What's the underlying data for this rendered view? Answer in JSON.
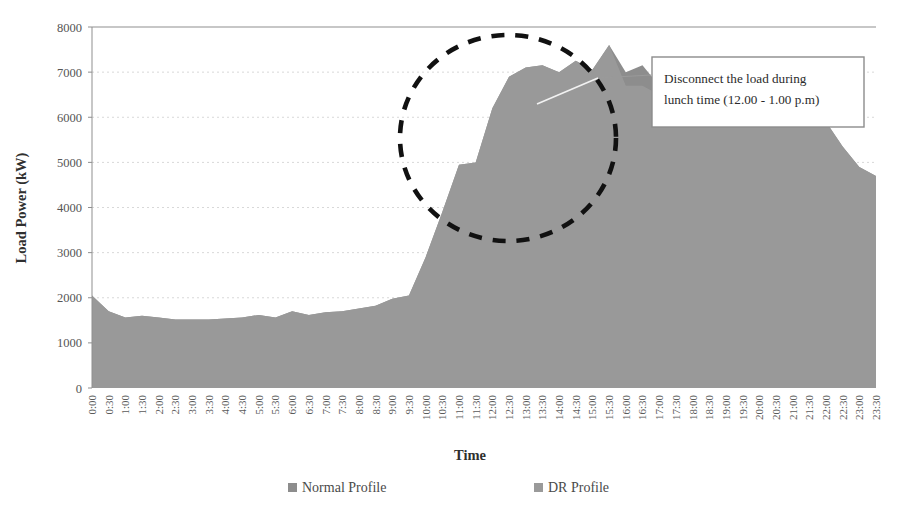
{
  "chart_data": {
    "type": "area",
    "title": "",
    "xlabel": "Time",
    "ylabel": "Load Power (kW)",
    "ylim": [
      0,
      8000
    ],
    "ytick_step": 1000,
    "yticks": [
      0,
      1000,
      2000,
      3000,
      4000,
      5000,
      6000,
      7000,
      8000
    ],
    "grid": true,
    "grid_style": "dotted-horizontal",
    "legend_position": "bottom",
    "categories": [
      "0:00",
      "0:30",
      "1:00",
      "1:30",
      "2:00",
      "2:30",
      "3:00",
      "3:30",
      "4:00",
      "4:30",
      "5:00",
      "5:30",
      "6:00",
      "6:30",
      "7:00",
      "7:30",
      "8:00",
      "8:30",
      "9:00",
      "9:30",
      "10:00",
      "10:30",
      "11:00",
      "11:30",
      "12:00",
      "12:30",
      "13:00",
      "13:30",
      "14:00",
      "14:30",
      "15:00",
      "15:30",
      "16:00",
      "16:30",
      "17:00",
      "17:30",
      "18:00",
      "18:30",
      "19:00",
      "19:30",
      "20:00",
      "20:30",
      "21:00",
      "21:30",
      "22:00",
      "22:30",
      "23:00",
      "23:30"
    ],
    "series": [
      {
        "name": "Normal Profile",
        "color": "#8d8d8d",
        "values": [
          2050,
          1700,
          1560,
          1600,
          1560,
          1520,
          1520,
          1520,
          1540,
          1560,
          1620,
          1560,
          1700,
          1620,
          1680,
          1700,
          1760,
          1820,
          1980,
          2050,
          2900,
          3900,
          4950,
          5000,
          6200,
          6900,
          7100,
          7150,
          7000,
          7250,
          7050,
          7600,
          7000,
          7150,
          6700,
          7000,
          6900,
          7100,
          7050,
          7200,
          7250,
          7150,
          7000,
          6600,
          5900,
          5350,
          4900,
          4700
        ]
      },
      {
        "name": "DR Profile",
        "color": "#9a9a9a",
        "values": [
          2050,
          1700,
          1560,
          1600,
          1560,
          1520,
          1520,
          1520,
          1540,
          1560,
          1620,
          1560,
          1700,
          1620,
          1680,
          1700,
          1760,
          1820,
          1980,
          2050,
          2900,
          3900,
          4950,
          5000,
          6200,
          6900,
          7100,
          7150,
          7000,
          7250,
          7050,
          7600,
          6700,
          6700,
          6500,
          6500,
          6900,
          7100,
          7050,
          7200,
          7250,
          7150,
          7000,
          6600,
          5900,
          5350,
          4900,
          4700
        ]
      }
    ]
  },
  "axes": {
    "y_title": "Load Power (kW)",
    "x_title": "Time",
    "y_tick_labels": [
      "8000",
      "7000",
      "6000",
      "5000",
      "4000",
      "3000",
      "2000",
      "1000",
      "0"
    ],
    "x_tick_labels": [
      "0:00",
      "0:30",
      "1:00",
      "1:30",
      "2:00",
      "2:30",
      "3:00",
      "3:30",
      "4:00",
      "4:30",
      "5:00",
      "5:30",
      "6:00",
      "6:30",
      "7:00",
      "7:30",
      "8:00",
      "8:30",
      "9:00",
      "9:30",
      "10:00",
      "10:30",
      "11:00",
      "11:30",
      "12:00",
      "12:30",
      "13:00",
      "13:30",
      "14:00",
      "14:30",
      "15:00",
      "15:30",
      "16:00",
      "16:30",
      "17:00",
      "17:30",
      "18:00",
      "18:30",
      "19:00",
      "19:30",
      "20:00",
      "20:30",
      "21:00",
      "21:30",
      "22:00",
      "22:30",
      "23:00",
      "23:30"
    ]
  },
  "legend": {
    "items": [
      {
        "label": "Normal Profile",
        "color": "#8d8d8d"
      },
      {
        "label": "DR Profile",
        "color": "#9a9a9a"
      }
    ]
  },
  "annotation": {
    "line1": "Disconnect the load during",
    "line2": "lunch time (12.00 - 1.00 p.m)",
    "highlight_shape": "dashed-ellipse",
    "highlight_color": "#111111"
  },
  "colors": {
    "area_fill": "#8d8d8d",
    "dr_fill": "#9a9a9a",
    "plot_border": "#8f8f8f",
    "grid": "#d8d8d8",
    "background": "#ffffff",
    "text": "#3c3c3c"
  }
}
